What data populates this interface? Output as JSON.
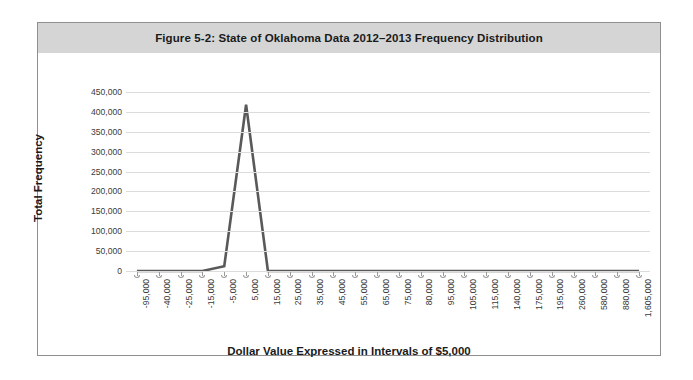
{
  "figure": {
    "title": "Figure 5-2: State of Oklahoma Data 2012–2013 Frequency Distribution"
  },
  "chart_data": {
    "type": "line",
    "title": "Figure 5-2: State of Oklahoma Data 2012–2013 Frequency Distribution",
    "xlabel": "Dollar Value Expressed in Intervals of $5,000",
    "ylabel": "Total Frequency",
    "grid": true,
    "legend": "none",
    "ylim": [
      0,
      450000
    ],
    "ytick_step": 50000,
    "ytick_labels": [
      "450,000",
      "400,000",
      "350,000",
      "300,000",
      "250,000",
      "200,000",
      "150,000",
      "100,000",
      "50,000",
      "0"
    ],
    "ytick_values": [
      450000,
      400000,
      350000,
      300000,
      250000,
      200000,
      150000,
      100000,
      50000,
      0
    ],
    "categories": [
      "-95,000",
      "-40,000",
      "-25,000",
      "-15,000",
      "-5,000",
      "5,000",
      "15,000",
      "25,000",
      "35,000",
      "45,000",
      "55,000",
      "65,000",
      "75,000",
      "80,000",
      "95,000",
      "105,000",
      "115,000",
      "140,000",
      "175,000",
      "195,000",
      "260,000",
      "580,000",
      "880,000",
      "1,605,000"
    ],
    "values": [
      0,
      0,
      0,
      0,
      12000,
      418000,
      0,
      0,
      0,
      0,
      0,
      0,
      0,
      0,
      0,
      0,
      0,
      0,
      0,
      0,
      0,
      0,
      0,
      0
    ],
    "series_color": "#595959",
    "grid_color": "#dcdcdc",
    "band_color": "#d5d5d5"
  }
}
